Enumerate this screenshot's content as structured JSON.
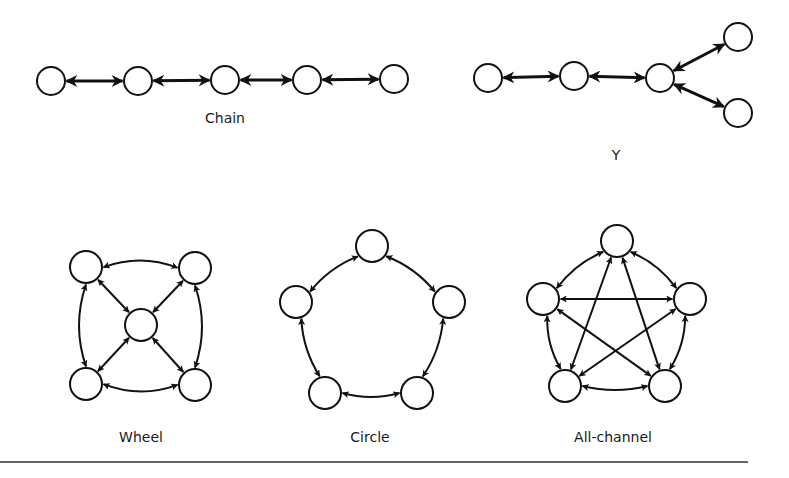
{
  "diagram": {
    "stroke_color": "#111111",
    "background": "#ffffff",
    "networks": [
      {
        "id": "chain",
        "label": "Chain",
        "label_pos": [
          225,
          123
        ],
        "node_radius": 14,
        "nodes": [
          [
            51,
            81
          ],
          [
            138,
            81
          ],
          [
            225,
            80
          ],
          [
            307,
            80
          ],
          [
            394,
            79
          ]
        ],
        "edges": [
          [
            0,
            1
          ],
          [
            1,
            2
          ],
          [
            2,
            3
          ],
          [
            3,
            4
          ]
        ],
        "curved": []
      },
      {
        "id": "y",
        "label": "Y",
        "label_pos": [
          616,
          160
        ],
        "node_radius": 14,
        "nodes": [
          [
            488,
            78
          ],
          [
            574,
            76
          ],
          [
            660,
            78
          ],
          [
            738,
            37
          ],
          [
            738,
            113
          ]
        ],
        "edges": [
          [
            0,
            1
          ],
          [
            1,
            2
          ],
          [
            2,
            3
          ],
          [
            2,
            4
          ]
        ],
        "curved": []
      },
      {
        "id": "wheel",
        "label": "Wheel",
        "label_pos": [
          141,
          442
        ],
        "node_radius": 16,
        "nodes": [
          [
            86,
            267
          ],
          [
            195,
            268
          ],
          [
            141,
            325
          ],
          [
            86,
            384
          ],
          [
            195,
            385
          ]
        ],
        "edges": [
          [
            0,
            2
          ],
          [
            1,
            2
          ],
          [
            3,
            2
          ],
          [
            4,
            2
          ]
        ],
        "curved": [
          [
            0,
            1,
            -14
          ],
          [
            1,
            4,
            -14
          ],
          [
            4,
            3,
            -14
          ],
          [
            3,
            0,
            -14
          ]
        ]
      },
      {
        "id": "circle",
        "label": "Circle",
        "label_pos": [
          370,
          442
        ],
        "node_radius": 16,
        "nodes": [
          [
            372,
            246
          ],
          [
            449,
            302
          ],
          [
            417,
            393
          ],
          [
            325,
            393
          ],
          [
            296,
            302
          ]
        ],
        "edges": [],
        "curved": [
          [
            0,
            1,
            -8
          ],
          [
            1,
            2,
            -8
          ],
          [
            2,
            3,
            -8
          ],
          [
            3,
            4,
            -8
          ],
          [
            4,
            0,
            -8
          ]
        ]
      },
      {
        "id": "all-channel",
        "label": "All-channel",
        "label_pos": [
          613,
          442
        ],
        "node_radius": 16,
        "nodes": [
          [
            617,
            241
          ],
          [
            690,
            299
          ],
          [
            665,
            386
          ],
          [
            565,
            386
          ],
          [
            543,
            299
          ]
        ],
        "edges": [
          [
            4,
            1
          ],
          [
            0,
            3
          ],
          [
            0,
            2
          ],
          [
            4,
            2
          ],
          [
            1,
            3
          ]
        ],
        "curved": [
          [
            0,
            1,
            -8
          ],
          [
            1,
            2,
            -8
          ],
          [
            2,
            3,
            -8
          ],
          [
            3,
            4,
            -8
          ],
          [
            4,
            0,
            -8
          ]
        ]
      }
    ],
    "rule": {
      "x1": 0,
      "x2": 748,
      "y": 462
    }
  }
}
